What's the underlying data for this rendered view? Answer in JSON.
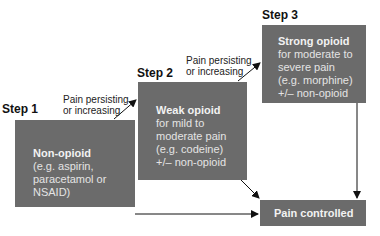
{
  "steps": [
    {
      "label": "Step 1",
      "title": "Non-opioid",
      "lines": [
        "(e.g. aspirin,",
        "paracetamol or",
        "NSAID)"
      ]
    },
    {
      "label": "Step 2",
      "title": "Weak opioid",
      "lines": [
        "for mild to",
        "moderate pain",
        "(e.g. codeine)",
        "+/– non-opioid"
      ]
    },
    {
      "label": "Step 3",
      "title": "Strong opioid",
      "lines": [
        "for moderate to",
        "severe pain",
        "(e.g. morphine)",
        "+/– non-opioid"
      ]
    }
  ],
  "outcome": {
    "title": "Pain controlled"
  },
  "conditions": [
    {
      "line1": "Pain persisting",
      "line2": "or increasing"
    },
    {
      "line1": "Pain persisting",
      "line2": "or increasing"
    }
  ],
  "colors": {
    "box": "#6b6b6b",
    "text": "#f2f2f2",
    "arrow": "#111111"
  }
}
